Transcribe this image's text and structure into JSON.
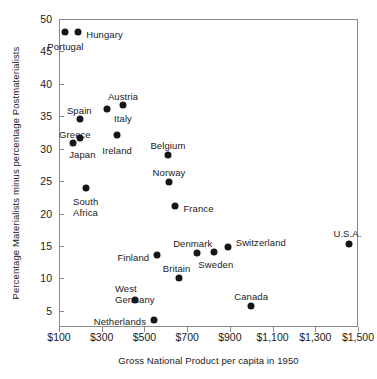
{
  "chart_data": {
    "type": "scatter",
    "title": "",
    "xlabel": "Gross National Product per capita in 1950",
    "ylabel": "Percentage Materialists minus percentage Postmaterialists",
    "xlim": [
      100,
      1500
    ],
    "ylim": [
      2.5,
      50
    ],
    "grid": false,
    "legend": "none",
    "xtick_labels": [
      "$100",
      "$300",
      "$500",
      "$700",
      "$900",
      "$1,100",
      "$1,300",
      "$1,500"
    ],
    "xtick_values": [
      100,
      300,
      500,
      700,
      900,
      1100,
      1300,
      1500
    ],
    "ytick_labels": [
      "5",
      "10",
      "15",
      "20",
      "25",
      "30",
      "35",
      "40",
      "45",
      "50"
    ],
    "ytick_values": [
      5,
      10,
      15,
      20,
      25,
      30,
      35,
      40,
      45,
      50
    ],
    "marker_color": "#161616",
    "points": [
      {
        "label": "Portugal",
        "x": 130,
        "y": 48.0,
        "label_dx": 0,
        "label_dy": 15,
        "align": "center"
      },
      {
        "label": "Hungary",
        "x": 190,
        "y": 48.0,
        "label_dx": 8,
        "label_dy": 3,
        "align": "left"
      },
      {
        "label": "Spain",
        "x": 200,
        "y": 34.6,
        "label_dx": -1,
        "label_dy": -8,
        "align": "center"
      },
      {
        "label": "Greece",
        "x": 165,
        "y": 30.9,
        "label_dx": 2,
        "label_dy": -8,
        "align": "center"
      },
      {
        "label": "Japan",
        "x": 200,
        "y": 31.7,
        "label_dx": 2,
        "label_dy": 17,
        "align": "center"
      },
      {
        "label": "Austria",
        "x": 400,
        "y": 36.8,
        "label_dx": 0,
        "label_dy": -8,
        "align": "center"
      },
      {
        "label": "Italy",
        "x": 325,
        "y": 36.1,
        "label_dx": 7,
        "label_dy": 10,
        "align": "left"
      },
      {
        "label": "Ireland",
        "x": 372,
        "y": 32.1,
        "label_dx": 0,
        "label_dy": 16,
        "align": "center"
      },
      {
        "label": "Belgium",
        "x": 610,
        "y": 29.0,
        "label_dx": 0,
        "label_dy": -9,
        "align": "center"
      },
      {
        "label": "Norway",
        "x": 615,
        "y": 24.8,
        "label_dx": 0,
        "label_dy": -9,
        "align": "center"
      },
      {
        "label": "France",
        "x": 645,
        "y": 21.1,
        "label_dx": 8,
        "label_dy": 3,
        "align": "left"
      },
      {
        "label": "South\nAfrica",
        "x": 225,
        "y": 24.0,
        "label_dx": 0,
        "label_dy": 14,
        "align": "center"
      },
      {
        "label": "Finland",
        "x": 560,
        "y": 13.6,
        "label_dx": -8,
        "label_dy": 3,
        "align": "right"
      },
      {
        "label": "Denmark",
        "x": 745,
        "y": 13.9,
        "label_dx": -4,
        "label_dy": -9,
        "align": "center"
      },
      {
        "label": "Sweden",
        "x": 825,
        "y": 14.1,
        "label_dx": 2,
        "label_dy": 13,
        "align": "center"
      },
      {
        "label": "Switzerland",
        "x": 890,
        "y": 14.9,
        "label_dx": 8,
        "label_dy": -4,
        "align": "left"
      },
      {
        "label": "U.S.A.",
        "x": 1460,
        "y": 15.3,
        "label_dx": -2,
        "label_dy": -10,
        "align": "center"
      },
      {
        "label": "Britain",
        "x": 660,
        "y": 10.1,
        "label_dx": -2,
        "label_dy": -9,
        "align": "center"
      },
      {
        "label": "West\nGermany",
        "x": 455,
        "y": 6.6,
        "label_dx": 0,
        "label_dy": -11,
        "align": "center"
      },
      {
        "label": "Canada",
        "x": 1000,
        "y": 5.8,
        "label_dx": 0,
        "label_dy": -9,
        "align": "center"
      },
      {
        "label": "Netherlands",
        "x": 545,
        "y": 3.6,
        "label_dx": -8,
        "label_dy": 2,
        "align": "right"
      }
    ]
  }
}
